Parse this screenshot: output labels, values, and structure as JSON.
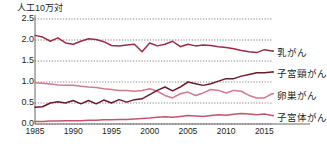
{
  "chart_data": {
    "type": "line",
    "title": "",
    "ylabel": "人工10万対",
    "xlabel": "",
    "ylim": [
      0.0,
      2.5
    ],
    "xlim": [
      1985,
      2016
    ],
    "grid": true,
    "grid_style": "dotted-horizontal",
    "legend_position": "right-of-plot",
    "ytick_labels": [
      "2.5",
      "2.0",
      "1.5",
      "1.0",
      "0.5",
      "0.0"
    ],
    "ytick_values": [
      2.5,
      2.0,
      1.5,
      1.0,
      0.5,
      0.0
    ],
    "xtick_labels": [
      "1985",
      "1990",
      "1995",
      "2000",
      "2005",
      "2010",
      "2015"
    ],
    "xtick_values": [
      1985,
      1990,
      1995,
      2000,
      2005,
      2010,
      2015
    ],
    "x": [
      1985,
      1986,
      1987,
      1988,
      1989,
      1990,
      1991,
      1992,
      1993,
      1994,
      1995,
      1996,
      1997,
      1998,
      1999,
      2000,
      2001,
      2002,
      2003,
      2004,
      2005,
      2006,
      2007,
      2008,
      2009,
      2010,
      2011,
      2012,
      2013,
      2014,
      2015,
      2016
    ],
    "series": [
      {
        "name": "乳がん",
        "color": "#9e2b45",
        "values": [
          2.11,
          2.07,
          1.97,
          2.05,
          1.93,
          1.9,
          1.97,
          2.03,
          2.01,
          1.96,
          1.87,
          1.86,
          1.88,
          1.9,
          1.72,
          1.93,
          1.86,
          1.9,
          1.97,
          1.84,
          1.9,
          1.86,
          1.88,
          1.87,
          1.84,
          1.82,
          1.79,
          1.75,
          1.72,
          1.7,
          1.77,
          1.74
        ]
      },
      {
        "name": "子宮頸がん",
        "color": "#6b1a2b",
        "values": [
          0.4,
          0.41,
          0.5,
          0.53,
          0.5,
          0.56,
          0.48,
          0.56,
          0.48,
          0.57,
          0.5,
          0.58,
          0.52,
          0.58,
          0.6,
          0.7,
          0.8,
          0.88,
          0.79,
          0.88,
          1.0,
          0.96,
          0.92,
          0.96,
          1.02,
          1.08,
          1.08,
          1.14,
          1.18,
          1.22,
          1.22,
          1.24
        ]
      },
      {
        "name": "卵巣がん",
        "color": "#d4788c",
        "values": [
          0.98,
          0.97,
          0.95,
          0.93,
          0.92,
          0.92,
          0.9,
          0.88,
          0.87,
          0.84,
          0.82,
          0.8,
          0.8,
          0.78,
          0.8,
          0.84,
          0.78,
          0.68,
          0.62,
          0.72,
          0.76,
          0.68,
          0.74,
          0.82,
          0.8,
          0.74,
          0.8,
          0.78,
          0.68,
          0.62,
          0.62,
          0.72
        ]
      },
      {
        "name": "子宮体がん",
        "color": "#c4556b",
        "values": [
          0.06,
          0.06,
          0.07,
          0.07,
          0.08,
          0.08,
          0.08,
          0.09,
          0.09,
          0.1,
          0.1,
          0.11,
          0.11,
          0.12,
          0.13,
          0.14,
          0.16,
          0.17,
          0.16,
          0.18,
          0.2,
          0.19,
          0.18,
          0.2,
          0.22,
          0.21,
          0.23,
          0.25,
          0.24,
          0.22,
          0.24,
          0.2
        ]
      }
    ]
  }
}
